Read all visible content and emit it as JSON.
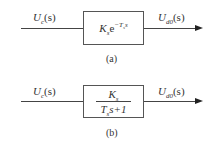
{
  "diagram_a": {
    "input_label_main": "U",
    "input_label_sub": "c",
    "input_label_arg": "(s)",
    "output_label_main": "U",
    "output_label_sub": "d0",
    "output_label_arg": "(s)",
    "block_gain_main": "K",
    "block_gain_sub": "s",
    "block_exp": "e",
    "block_exp_sup_main": "−T",
    "block_exp_sup_sub": "s",
    "block_exp_sup_var": "s",
    "caption": "(a)"
  },
  "diagram_b": {
    "input_label_main": "U",
    "input_label_sub": "c",
    "input_label_arg": "(s)",
    "output_label_main": "U",
    "output_label_sub": "d0",
    "output_label_arg": "(s)",
    "numerator_main": "K",
    "numerator_sub": "s",
    "denominator_main": "T",
    "denominator_sub": "s",
    "denominator_rest": "s+1",
    "caption": "(b)"
  }
}
